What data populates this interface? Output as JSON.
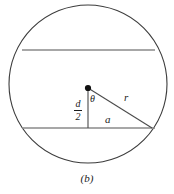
{
  "figure": {
    "caption": "(b)",
    "colors": {
      "circle_stroke": "#3c3c3c",
      "chord_stroke": "#8a8a8a",
      "triangle_stroke": "#4a4a4a",
      "center_dot": "#111111",
      "label_text": "#1a1a1a",
      "background": "#ffffff"
    },
    "geometry": {
      "circle": {
        "cx": 88,
        "cy": 84,
        "r": 79
      },
      "center_point": {
        "x": 88,
        "y": 88
      },
      "upper_chord": {
        "x1": 22,
        "y1": 50,
        "x2": 155,
        "y2": 50
      },
      "lower_chord": {
        "x1": 22,
        "y1": 128,
        "x2": 155,
        "y2": 128
      },
      "vertical_leg": {
        "x1": 88,
        "y1": 88,
        "x2": 88,
        "y2": 128
      },
      "horizontal_leg": {
        "x1": 88,
        "y1": 128,
        "x2": 152,
        "y2": 128
      },
      "hypotenuse": {
        "x1": 88,
        "y1": 88,
        "x2": 152,
        "y2": 128
      },
      "right_vertex": {
        "x": 152,
        "y": 128
      }
    },
    "labels": {
      "radius": "r",
      "half_chord": "a",
      "angle": "θ",
      "distance_numerator": "d",
      "distance_denominator": "2"
    }
  }
}
